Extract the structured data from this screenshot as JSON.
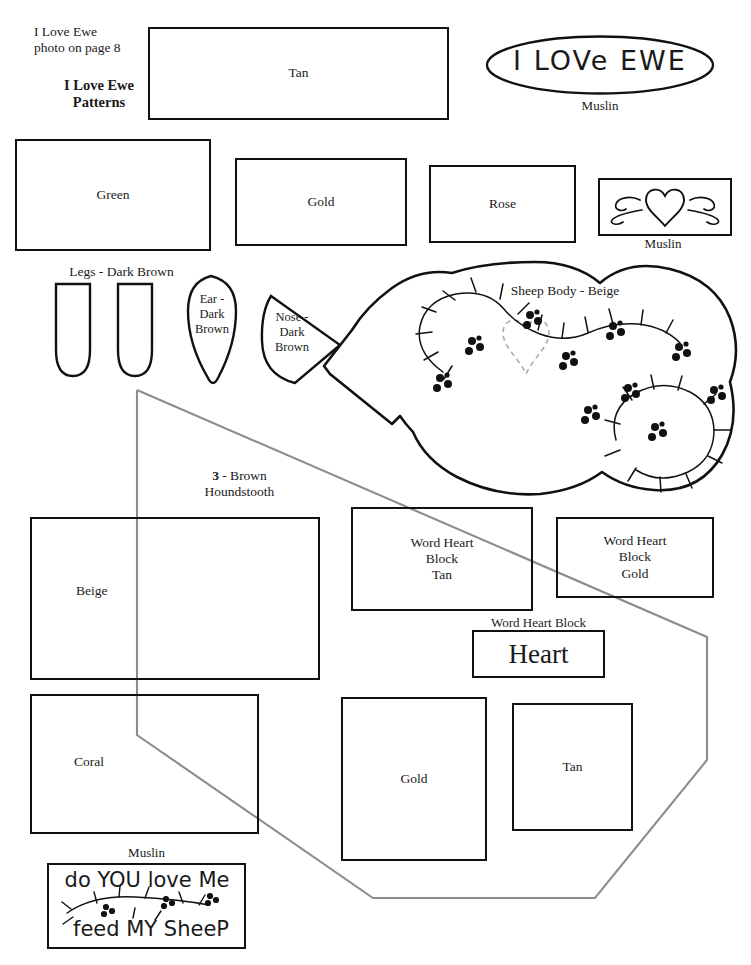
{
  "document": {
    "title": "I Love Ewe Patterns",
    "header_note": "I Love Ewe\nphoto on page 8",
    "header_title": "I Love Ewe\nPatterns"
  },
  "pattern_pieces": [
    {
      "id": "tan-top",
      "label": "Tan",
      "x": 148,
      "y": 27,
      "w": 301,
      "h": 93
    },
    {
      "id": "green",
      "label": "Green",
      "x": 15,
      "y": 139,
      "w": 196,
      "h": 112
    },
    {
      "id": "gold-top",
      "label": "Gold",
      "x": 235,
      "y": 158,
      "w": 172,
      "h": 88
    },
    {
      "id": "rose",
      "label": "Rose",
      "x": 429,
      "y": 165,
      "w": 147,
      "h": 78
    },
    {
      "id": "muslin-heart",
      "label": "",
      "x": 598,
      "y": 178,
      "w": 134,
      "h": 58
    },
    {
      "id": "word-heart-tan",
      "label": "Word Heart\nBlock\nTan",
      "x": 351,
      "y": 507,
      "w": 182,
      "h": 104
    },
    {
      "id": "word-heart-gold",
      "label": "Word Heart\nBlock\nGold",
      "x": 556,
      "y": 517,
      "w": 158,
      "h": 81
    },
    {
      "id": "word-heart-word",
      "label": "",
      "x": 472,
      "y": 619,
      "w": 133,
      "h": 56
    },
    {
      "id": "beige",
      "label": "Beige",
      "x": 30,
      "y": 517,
      "w": 290,
      "h": 163
    },
    {
      "id": "coral",
      "label": "Coral",
      "x": 30,
      "y": 694,
      "w": 229,
      "h": 140
    },
    {
      "id": "gold-bottom",
      "label": "Gold",
      "x": 341,
      "y": 697,
      "w": 146,
      "h": 164
    },
    {
      "id": "tan-bottom",
      "label": "Tan",
      "x": 512,
      "y": 703,
      "w": 121,
      "h": 128
    },
    {
      "id": "muslin-verse",
      "label": "",
      "x": 47,
      "y": 863,
      "w": 199,
      "h": 86
    }
  ],
  "captions": {
    "muslin_oval": "Muslin",
    "muslin_heart_box": "Muslin",
    "muslin_verse_box": "Muslin",
    "legs": "Legs - Dark Brown",
    "ear": "Ear -\nDark\nBrown",
    "nose": "Nose -\nDark\nBrown",
    "sheep_body": "Sheep Body  - Beige",
    "houndstooth_count": "3",
    "houndstooth_rest": " - Brown\nHoundstooth",
    "word_heart_block": "Word Heart Block"
  },
  "handwritten": {
    "oval_text": "I LOVe EWE",
    "heart_word": "Heart",
    "verse_line1": "do YOU love Me",
    "verse_line2": "feed MY SheeP"
  },
  "colors": {
    "ink": "#111111",
    "guide_line": "#8c8c8c",
    "paper": "#ffffff"
  }
}
